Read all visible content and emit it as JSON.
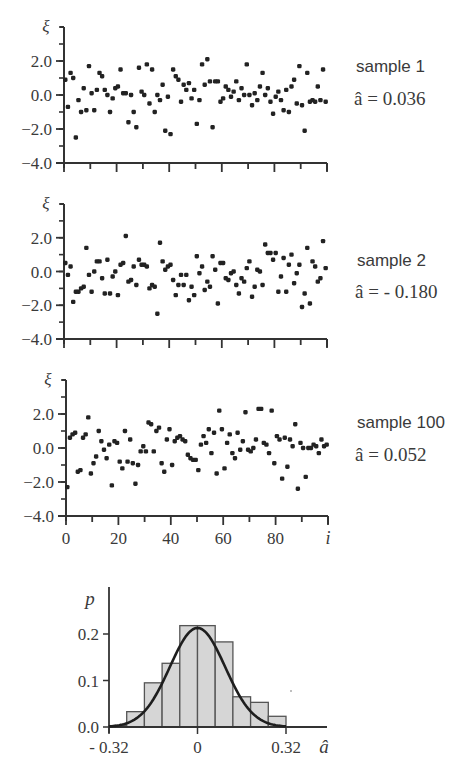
{
  "chart_data": [
    {
      "type": "scatter",
      "title": "sample 1",
      "annotation": "â = 0.036",
      "estimate": 0.036,
      "xlabel": "i",
      "ylabel": "ξ",
      "xlim": [
        0,
        100
      ],
      "ylim": [
        -4.0,
        4.0
      ],
      "yticks": [
        2.0,
        0.0,
        -2.0,
        -4.0
      ],
      "ytick_labels": [
        "2.0",
        "0.0",
        "−2.0",
        "−4.0"
      ],
      "x": [
        0,
        1,
        2,
        3,
        4,
        5,
        6,
        7,
        8,
        9,
        10,
        11,
        12,
        13,
        14,
        15,
        16,
        17,
        18,
        19,
        20,
        21,
        22,
        23,
        24,
        25,
        26,
        27,
        28,
        29,
        30,
        31,
        32,
        33,
        34,
        35,
        36,
        37,
        38,
        39,
        40,
        41,
        42,
        43,
        44,
        45,
        46,
        47,
        48,
        49,
        50,
        51,
        52,
        53,
        54,
        55,
        56,
        57,
        58,
        59,
        60,
        61,
        62,
        63,
        64,
        65,
        66,
        67,
        68,
        69,
        70,
        71,
        72,
        73,
        74,
        75,
        76,
        77,
        78,
        79,
        80,
        81,
        82,
        83,
        84,
        85,
        86,
        87,
        88,
        89,
        90,
        91,
        92,
        93,
        94,
        95,
        96,
        97,
        98,
        99
      ],
      "y": [
        0.9,
        -0.7,
        1.3,
        1.0,
        -2.5,
        -0.3,
        -1.0,
        0.4,
        -0.9,
        1.7,
        0.1,
        -0.9,
        0.3,
        1.3,
        1.1,
        0.3,
        0.0,
        -1.0,
        -0.2,
        0.4,
        0.5,
        1.5,
        0.1,
        0.1,
        -1.6,
        0.0,
        -1.0,
        -1.9,
        1.6,
        0.2,
        0.0,
        1.8,
        -0.5,
        1.5,
        -1.0,
        0.0,
        -0.3,
        0.6,
        -2.1,
        -0.1,
        -2.3,
        1.5,
        1.1,
        0.9,
        -0.4,
        0.6,
        0.3,
        0.7,
        -0.2,
        0.3,
        -1.7,
        -0.3,
        1.8,
        0.6,
        2.1,
        0.8,
        -1.9,
        0.8,
        0.8,
        -0.4,
        -0.2,
        0.5,
        0.3,
        -0.1,
        0.2,
        0.8,
        -0.3,
        0.4,
        0.0,
        1.8,
        0.0,
        -0.6,
        0.1,
        -0.3,
        0.5,
        1.3,
        0.0,
        0.4,
        -0.4,
        -1.1,
        -0.1,
        0.2,
        -0.3,
        -0.9,
        0.3,
        -1.0,
        0.5,
        0.9,
        -0.5,
        1.7,
        -0.6,
        -2.1,
        1.3,
        -0.4,
        -0.3,
        -0.4,
        0.5,
        -0.3,
        1.5,
        -0.4
      ]
    },
    {
      "type": "scatter",
      "title": "sample 2",
      "annotation": "â = - 0.180",
      "estimate": -0.18,
      "xlabel": "i",
      "ylabel": "ξ",
      "xlim": [
        0,
        100
      ],
      "ylim": [
        -4.0,
        4.0
      ],
      "yticks": [
        2.0,
        0.0,
        -2.0,
        -4.0
      ],
      "ytick_labels": [
        "2.0",
        "0.0",
        "−2.0",
        "−4.0"
      ],
      "x": [
        0,
        1,
        2,
        3,
        4,
        5,
        6,
        7,
        8,
        9,
        10,
        11,
        12,
        13,
        14,
        15,
        16,
        17,
        18,
        19,
        20,
        21,
        22,
        23,
        24,
        25,
        26,
        27,
        28,
        29,
        30,
        31,
        32,
        33,
        34,
        35,
        36,
        37,
        38,
        39,
        40,
        41,
        42,
        43,
        44,
        45,
        46,
        47,
        48,
        49,
        50,
        51,
        52,
        53,
        54,
        55,
        56,
        57,
        58,
        59,
        60,
        61,
        62,
        63,
        64,
        65,
        66,
        67,
        68,
        69,
        70,
        71,
        72,
        73,
        74,
        75,
        76,
        77,
        78,
        79,
        80,
        81,
        82,
        83,
        84,
        85,
        86,
        87,
        88,
        89,
        90,
        91,
        92,
        93,
        94,
        95,
        96,
        97,
        98,
        99
      ],
      "y": [
        0.5,
        -0.2,
        0.3,
        -1.8,
        -1.2,
        -1.2,
        -1.0,
        -0.9,
        1.4,
        -0.2,
        -1.2,
        0.0,
        0.6,
        0.6,
        -0.4,
        -1.3,
        0.7,
        -1.3,
        -0.3,
        0.0,
        -1.4,
        0.4,
        0.5,
        2.1,
        -0.6,
        -0.5,
        0.3,
        -0.8,
        0.7,
        0.4,
        0.4,
        0.3,
        -1.0,
        -0.8,
        -0.9,
        -2.5,
        1.7,
        0.6,
        0.1,
        0.3,
        0.4,
        -0.5,
        -1.4,
        -0.8,
        -0.2,
        -0.8,
        -0.2,
        -1.7,
        -0.9,
        -1.4,
        0.9,
        -0.1,
        0.3,
        -1.1,
        -0.6,
        -0.9,
        0.9,
        0.1,
        -1.9,
        0.5,
        0.5,
        -0.4,
        -0.5,
        -0.1,
        0.0,
        -0.8,
        -1.3,
        -0.4,
        -0.6,
        0.2,
        0.6,
        -1.5,
        -0.9,
        0.1,
        0.0,
        -0.8,
        1.6,
        1.1,
        1.1,
        0.7,
        1.1,
        -1.2,
        -0.3,
        0.8,
        -1.2,
        0.4,
        1.0,
        -0.7,
        -0.1,
        0.4,
        -2.1,
        -1.3,
        1.4,
        -1.9,
        0.6,
        0.3,
        -0.6,
        -0.4,
        1.8,
        0.2
      ]
    },
    {
      "type": "scatter",
      "title": "sample 100",
      "annotation": "â = 0.052",
      "estimate": 0.052,
      "xlabel": "i",
      "ylabel": "ξ",
      "xlim": [
        0,
        100
      ],
      "ylim": [
        -4.0,
        4.0
      ],
      "xticks": [
        0,
        20,
        40,
        60,
        80
      ],
      "xtick_labels": [
        "0",
        "20",
        "40",
        "60",
        "80"
      ],
      "yticks": [
        2.0,
        0.0,
        -2.0,
        -4.0
      ],
      "ytick_labels": [
        "2.0",
        "0.0",
        "−2.0",
        "−4.0"
      ],
      "x": [
        0,
        1,
        2,
        3,
        4,
        5,
        6,
        7,
        8,
        9,
        10,
        11,
        12,
        13,
        14,
        15,
        16,
        17,
        18,
        19,
        20,
        21,
        22,
        23,
        24,
        25,
        26,
        27,
        28,
        29,
        30,
        31,
        32,
        33,
        34,
        35,
        36,
        37,
        38,
        39,
        40,
        41,
        42,
        43,
        44,
        45,
        46,
        47,
        48,
        49,
        50,
        51,
        52,
        53,
        54,
        55,
        56,
        57,
        58,
        59,
        60,
        61,
        62,
        63,
        64,
        65,
        66,
        67,
        68,
        69,
        70,
        71,
        72,
        73,
        74,
        75,
        76,
        77,
        78,
        79,
        80,
        81,
        82,
        83,
        84,
        85,
        86,
        87,
        88,
        89,
        90,
        91,
        92,
        93,
        94,
        95,
        96,
        97,
        98,
        99
      ],
      "y": [
        -2.3,
        0.6,
        0.8,
        0.9,
        -1.4,
        -1.3,
        0.6,
        0.8,
        1.8,
        -1.5,
        -0.9,
        -0.5,
        1.0,
        0.4,
        -0.1,
        -0.6,
        0.2,
        -2.2,
        0.4,
        0.3,
        -0.8,
        -1.2,
        1.0,
        -0.8,
        0.5,
        -0.9,
        -2.1,
        -1.0,
        -0.2,
        0.1,
        -0.2,
        1.5,
        1.4,
        -0.2,
        1.0,
        1.2,
        -0.9,
        -1.4,
        0.5,
        1.1,
        -1.0,
        0.4,
        0.6,
        0.7,
        0.5,
        0.4,
        -0.4,
        -0.6,
        -0.7,
        -0.7,
        -1.3,
        0.2,
        0.7,
        0.3,
        1.1,
        -0.3,
        0.9,
        -1.5,
        2.2,
        1.1,
        -1.2,
        0.3,
        0.8,
        -0.3,
        -0.6,
        0.9,
        -0.1,
        0.4,
        2.1,
        -0.1,
        -0.2,
        0.0,
        0.5,
        2.3,
        2.3,
        0.3,
        0.2,
        -0.3,
        2.2,
        -0.9,
        0.7,
        0.5,
        -1.8,
        0.6,
        -1.1,
        0.5,
        0.1,
        1.4,
        -2.4,
        0.3,
        0.0,
        -1.7,
        0.0,
        0.0,
        0.2,
        0.1,
        -0.3,
        0.5,
        0.1,
        0.2
      ]
    },
    {
      "type": "bar",
      "subtype": "histogram",
      "title": "",
      "xlabel": "â",
      "ylabel": "p",
      "xlim": [
        -0.32,
        0.32
      ],
      "ylim": [
        0.0,
        0.25
      ],
      "xticks": [
        -0.32,
        0,
        0.32
      ],
      "xtick_labels": [
        "- 0.32",
        "0",
        "0.32"
      ],
      "yticks": [
        0.0,
        0.1,
        0.2
      ],
      "ytick_labels": [
        "0.0",
        "0.1",
        "0.2"
      ],
      "bin_edges": [
        -0.32,
        -0.256,
        -0.192,
        -0.128,
        -0.064,
        0.0,
        0.064,
        0.128,
        0.192,
        0.256,
        0.32
      ],
      "categories": [
        "-0.288",
        "-0.224",
        "-0.160",
        "-0.096",
        "-0.032",
        "0.032",
        "0.096",
        "0.160",
        "0.224",
        "0.288"
      ],
      "values": [
        0.003,
        0.033,
        0.095,
        0.137,
        0.218,
        0.218,
        0.183,
        0.065,
        0.053,
        0.023
      ],
      "overlay": {
        "type": "line",
        "name": "normal density fit",
        "mean": 0.0,
        "sd": 0.1,
        "peak": 0.213
      }
    }
  ],
  "style": {
    "ink": "#222222",
    "axis": "#333333",
    "label": "#3a3a3a",
    "bar_fill": "#d6d6d6",
    "bar_stroke": "#555555",
    "curve": "#1e1e1e"
  }
}
